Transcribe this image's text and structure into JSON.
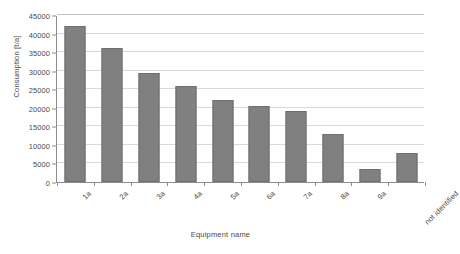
{
  "chart_data": {
    "type": "bar",
    "title": "",
    "subtitle": "",
    "xlabel": "Equipment name",
    "ylabel": "Consumption [t/a]",
    "categories": [
      "1a",
      "2a",
      "3a",
      "4a",
      "5a",
      "6a",
      "7a",
      "8a",
      "9a",
      "not identified"
    ],
    "values": [
      42000,
      36000,
      29500,
      25800,
      22000,
      20500,
      19200,
      13000,
      3500,
      7800
    ],
    "series": [
      {
        "name": "Consumption",
        "values": [
          42000,
          36000,
          29500,
          25800,
          22000,
          20500,
          19200,
          13000,
          3500,
          7800
        ]
      }
    ],
    "ylim": [
      0,
      45000
    ],
    "ytick_step": 5000,
    "yticks": [
      0,
      5000,
      10000,
      15000,
      20000,
      25000,
      30000,
      35000,
      40000,
      45000
    ],
    "ytick_labels": [
      "0",
      "5000",
      "10000",
      "15000",
      "20000",
      "25000",
      "30000",
      "35000",
      "40000",
      "45000"
    ],
    "grid": true,
    "grid_axis": "y",
    "legend": false,
    "legend_position": "none",
    "bar_color": "#808080",
    "bar_border_color": "#6e6e6e",
    "gridline_color": "#d9d9d9",
    "axis_color": "#8d8d8d",
    "text_color": "#4a4a4a",
    "background_color": "#ffffff",
    "xtick_label_rotation": -45,
    "annotations": []
  }
}
